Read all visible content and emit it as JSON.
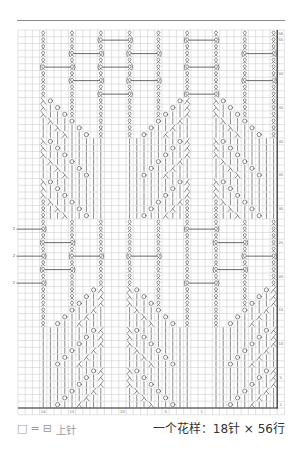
{
  "chart": {
    "columns": 36,
    "rows": 56,
    "colors": {
      "grid": "#c6c6c6",
      "border": "#2b2b2b",
      "symbol": "#4d4d4d",
      "label": "#777777",
      "divider": "#8a8a8a"
    },
    "symbol_key": {
      ".": "purl",
      "Q": "twisted-knit",
      "[": "cable-twisted-left",
      "]": "cable-twisted-right",
      "|": "knit",
      "O": "yarn-over",
      "R": "decrease-ru-glyph",
      "L": "decrease-ren-glyph"
    },
    "grid_rows": [
      "...Q...Q...Q...Q...Q...Q...Q...Q...Q",
      "...Q...Q...[...]...Q...[...]...Q...Q",
      "...Q...Q...Q...Q...Q...Q...Q...Q...Q",
      "...Q...[...]...[...]...Q...Q...[...]",
      "...Q...Q...Q...Q...Q...Q...Q...Q...Q",
      "...[...]...[...]...Q...[...]...Q...Q",
      "...Q...Q...Q...Q...Q...Q...Q...Q...Q",
      "...Q...[...]...[...]...Q...Q...[...]",
      "...Q...Q...Q...Q...Q...Q...Q...Q...Q",
      "...Q...Q...[...]...Q...[...]...Q...Q",
      "...RO..Q...Q...Q...Q..OL...RO..Q...Q",
      "...R|O.Q...Q...Q...Q.O|L...R|O.Q...Q",
      "...R||OQ...Q...Q...QO||L...R||OQ...Q",
      "...|R||O...Q...Q...O||L|...|R||O...Q",
      "...||R||O..Q...Q..O||L||...||R||O..Q",
      "...|||R||O.Q...Q.O||L|||...|||R||O.Q",
      "...RO|||||||...|||||||OL...RO|||||||",
      "...R|O||||||...||||||O|L...R|O||||||",
      "...R||O|||||...|||||O||L...R||O|||||",
      "...|R||O||||...||||O||L|...|R||O||||",
      "...||R||O|||...|||O||L||...||R||O|||",
      "...|||R||O||...||O||L|||...|||R||O||",
      "...RO|||||||...|||||||OL...RO|||||||",
      "...R|O||||||...||||||O|L...R|O||||||",
      "...R||O|||||...|||||O||L...R||O|||||",
      "...QR||O||||...||||O||LQ...QR||O||||",
      "...Q|R||O|||...|||O||L|Q...Q|R||O|||",
      "...Q||R||O||...||O||L||Q...Q||R||O||",
      "...Q...Q...Q...Q...Q...Q...Q...Q...Q",
      "...]...Q...Q...Q...Q...[...]...Q...Q",
      "...Q...Q...Q...Q...Q...Q...Q...Q...Q",
      "...[...]...Q...Q...Q...Q...[...]...Q",
      "...Q...Q...Q...Q...Q...Q...Q...Q...Q",
      "...]...[...]...[...]...Q...Q...[...]",
      "...Q...Q...Q...Q...Q...Q...Q...Q...Q",
      "...[...]...Q...Q...Q...Q...[...]...Q",
      "...Q...Q...Q...Q...Q...Q...Q...Q...Q",
      "...]...Q...Q...Q...Q...[...]...Q...Q",
      "...Q...Q..OL...RO..Q...Q...Q...Q..OL",
      "...Q...Q.O|L...R|O.Q...Q...Q...Q.O|L",
      "...Q...QO||L...R||OQ...Q...Q...QO||L",
      "...Q...O||L|...|R||O...Q...Q...O||L|",
      "...Q..O||L||...||R||O..Q...Q..O||L||",
      "...Q.O||L|||...|||R||O.Q...Q.O||L|||",
      "...|||||||OL...RO|||||||...|||||||OL",
      "...||||||O|L...R|O||||||...||||||O|L",
      "...|||||O||L...R||O|||||...|||||O||L",
      "...||||O||L|...|R||O||||...||||O||L|",
      "...|||O||L||...||R||O|||...|||O||L||",
      "...||O||L|||...|||R||O||...||O||L|||",
      "...|||||||OL...RO|||||||...|||||||OL",
      "...||||||O|L...R|O||||||...||||||O|L",
      "...|||||O||L...R||O|||||...|||||O||L",
      "...||||O||L|...|R||O||||...||||O||L|",
      "...|||O||L||...||R||O|||...|||O||L||",
      "...||O||L|||...|||R||O||...||O||L|||"
    ],
    "row_labels": [
      "56",
      "55",
      "50",
      "45",
      "40",
      "35",
      "30",
      "25",
      "20",
      "15",
      "10",
      "5",
      "1"
    ],
    "column_labels": [
      {
        "label": "18",
        "col": 3
      },
      {
        "label": "15",
        "col": 7
      },
      {
        "label": "10",
        "col": 14
      },
      {
        "label": "5",
        "col": 20
      },
      {
        "label": "1",
        "col": 25
      }
    ],
    "edge_cable_label": "2"
  },
  "legend": {
    "empty_square": "□",
    "equals": "=",
    "purl_square": "⊟",
    "label": "上针"
  },
  "repeat_info": "一个花样：18针 × 56行"
}
